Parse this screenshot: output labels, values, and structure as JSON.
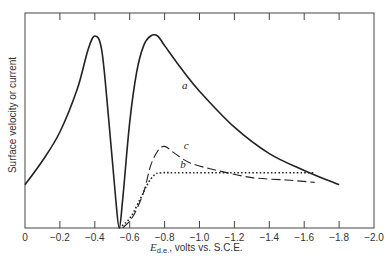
{
  "chart_data": {
    "type": "line",
    "title": "",
    "xlabel": "E d.e., volts vs. S.C.E.",
    "xlabel_parts": {
      "symbol": "E",
      "subscript": "d.e.",
      "rest": ", volts vs. S.C.E."
    },
    "ylabel": "Surface velocity or current",
    "xlim": [
      0,
      -2.0
    ],
    "x_ticks": [
      "0",
      "−0.2",
      "−0.4",
      "−0.6",
      "−0.8",
      "−1.0",
      "−1.2",
      "−1.4",
      "−1.6",
      "−1.8",
      "−2.0"
    ],
    "y_ticks": [],
    "grid": false,
    "legend": "inline curve labels",
    "series": [
      {
        "name": "a",
        "style": "solid",
        "x": [
          0,
          -0.1,
          -0.2,
          -0.3,
          -0.36,
          -0.4,
          -0.44,
          -0.48,
          -0.52,
          -0.54,
          -0.56,
          -0.6,
          -0.64,
          -0.68,
          -0.72,
          -0.76,
          -0.8,
          -0.9,
          -1.0,
          -1.2,
          -1.4,
          -1.6,
          -1.8
        ],
        "y": [
          0.18,
          0.28,
          0.4,
          0.58,
          0.74,
          0.8,
          0.74,
          0.45,
          0.12,
          0.0,
          0.12,
          0.44,
          0.65,
          0.76,
          0.8,
          0.8,
          0.76,
          0.66,
          0.57,
          0.42,
          0.31,
          0.24,
          0.18
        ]
      },
      {
        "name": "c",
        "style": "dashed",
        "x": [
          -0.56,
          -0.62,
          -0.68,
          -0.72,
          -0.76,
          -0.8,
          -0.86,
          -0.95,
          -1.1,
          -1.3,
          -1.5,
          -1.66
        ],
        "y": [
          0.0,
          0.05,
          0.15,
          0.26,
          0.32,
          0.34,
          0.31,
          0.27,
          0.24,
          0.21,
          0.2,
          0.19
        ]
      },
      {
        "name": "b",
        "style": "dotted",
        "x": [
          -0.54,
          -0.6,
          -0.66,
          -0.7,
          -0.74,
          -0.78,
          -0.9,
          -1.2,
          -1.5,
          -1.66
        ],
        "y": [
          0.0,
          0.04,
          0.12,
          0.18,
          0.22,
          0.23,
          0.23,
          0.23,
          0.23,
          0.23
        ]
      }
    ],
    "annotations": [
      {
        "text": "a",
        "x": -0.9,
        "y": 0.58
      },
      {
        "text": "c",
        "x": -0.91,
        "y": 0.33
      },
      {
        "text": "b",
        "x": -0.89,
        "y": 0.25
      }
    ]
  }
}
